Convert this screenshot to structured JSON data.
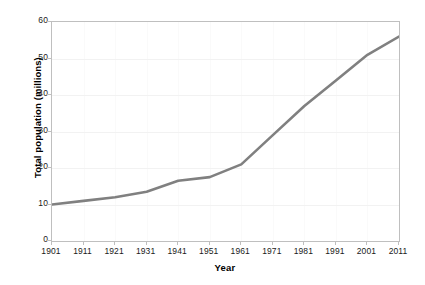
{
  "chart_data": {
    "type": "line",
    "title": "",
    "xlabel": "Year",
    "ylabel": "Total population (millions)",
    "x": [
      1901,
      1911,
      1921,
      1931,
      1941,
      1951,
      1961,
      1971,
      1981,
      1991,
      2001,
      2011
    ],
    "values": [
      10,
      11,
      12,
      13.5,
      16.5,
      17.5,
      21,
      29,
      37,
      44,
      51,
      56
    ],
    "series": [
      {
        "name": "Total population",
        "values": [
          10,
          11,
          12,
          13.5,
          16.5,
          17.5,
          21,
          29,
          37,
          44,
          51,
          56
        ],
        "color": "#808080"
      }
    ],
    "xtick_labels": [
      "1901",
      "1911",
      "1921",
      "1931",
      "1941",
      "1951",
      "1961",
      "1971",
      "1981",
      "1991",
      "2001",
      "2011"
    ],
    "ytick_labels": [
      "0",
      "10",
      "20",
      "30",
      "40",
      "50",
      "60"
    ],
    "ytick_values": [
      0,
      10,
      20,
      30,
      40,
      50,
      60
    ],
    "xlim": [
      1901,
      2011
    ],
    "ylim": [
      0,
      60
    ],
    "grid": true,
    "legend": false,
    "colors": {
      "line": "#808080",
      "grid": "#f2f2f2",
      "axis": "#bfbfbf",
      "text": "#1a1a1a",
      "background": "#ffffff"
    }
  }
}
